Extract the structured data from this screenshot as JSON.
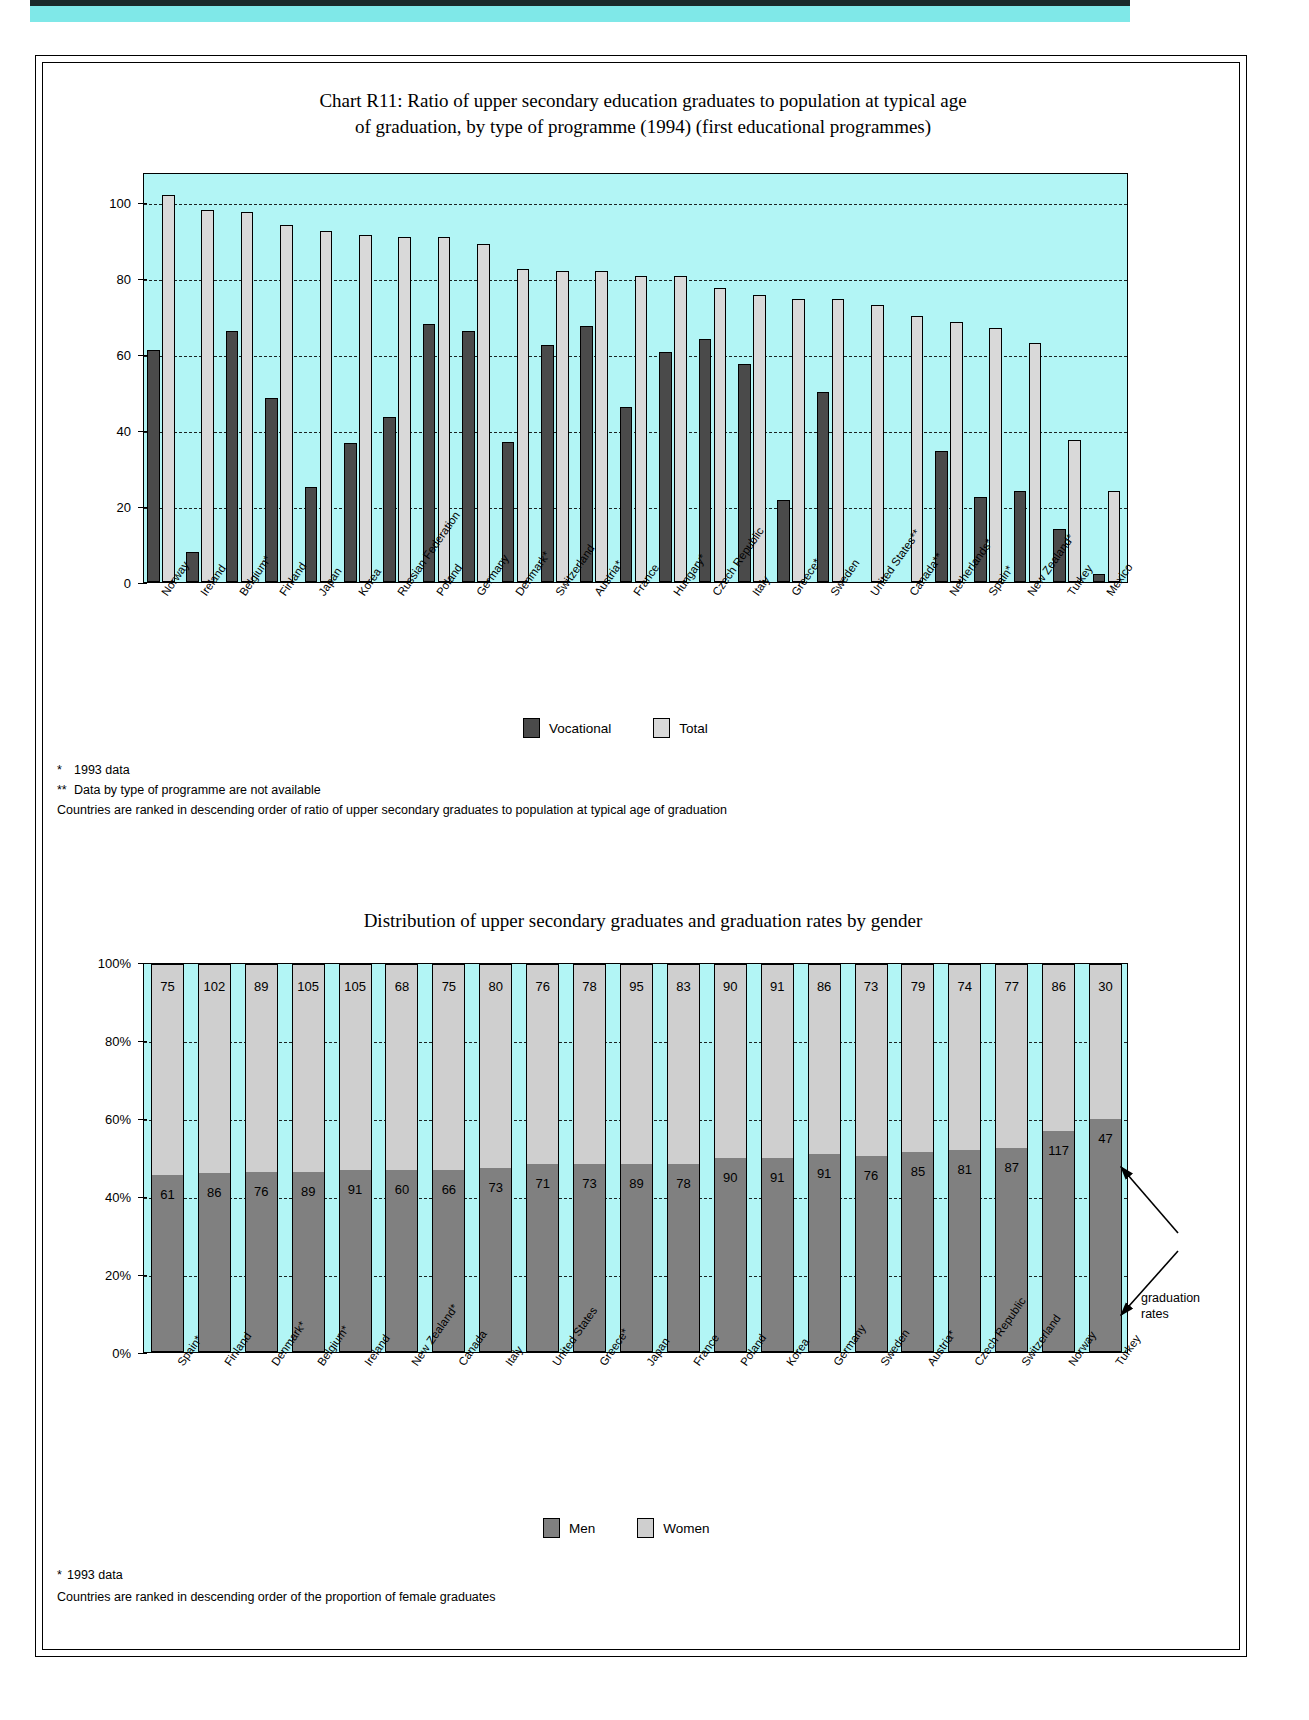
{
  "chart_data": [
    {
      "type": "bar",
      "id": "chart-r11",
      "title": "Chart R11: Ratio of upper secondary education graduates to population at typical age of graduation, by type of programme (1994) (first educational programmes)",
      "title_line1": "Chart R11: Ratio of upper secondary education graduates to population at typical age",
      "title_line2": "of graduation, by type of programme (1994) (first educational programmes)",
      "xlabel": "",
      "ylabel": "",
      "ylim": [
        0,
        108
      ],
      "yticks": [
        0,
        20,
        40,
        60,
        80,
        100
      ],
      "grid": true,
      "legend_position": "bottom",
      "categories": [
        "Norway",
        "Ireland",
        "Belgium*",
        "Finland",
        "Japan",
        "Korea",
        "Russian Federation",
        "Poland",
        "Germany",
        "Denmark*",
        "Switzerland",
        "Austria*",
        "France",
        "Hungary*",
        "Czech Republic",
        "Italy",
        "Greece*",
        "Sweden",
        "United States**",
        "Canada**",
        "Netherlands*",
        "Spain*",
        "New Zealand*",
        "Turkey",
        "Mexico"
      ],
      "series": [
        {
          "name": "Vocational",
          "color": "#4a4a4a",
          "values": [
            61,
            8,
            66,
            48.5,
            25,
            36.5,
            43.5,
            68,
            66,
            37,
            62.5,
            67.5,
            46,
            60.5,
            64,
            57.5,
            21.5,
            50,
            null,
            null,
            34.5,
            22.5,
            24,
            14,
            2
          ]
        },
        {
          "name": "Total",
          "color": "#d9d9d9",
          "values": [
            102,
            98,
            97.5,
            94,
            92.5,
            91.5,
            91,
            91,
            89,
            82.5,
            82,
            82,
            80.5,
            80.5,
            77.5,
            75.5,
            74.5,
            74.5,
            73,
            70,
            68.5,
            67,
            63,
            37.5,
            24
          ]
        }
      ],
      "notes": [
        {
          "marker": "*",
          "text": "1993 data"
        },
        {
          "marker": "**",
          "text": "Data by type of programme are not available"
        },
        {
          "marker": "",
          "text": "Countries are ranked in descending order of ratio of upper secondary graduates to population at typical age of graduation"
        }
      ]
    },
    {
      "type": "bar",
      "id": "chart-gender",
      "title": "Distribution of upper secondary graduates and graduation rates by gender",
      "stacked": true,
      "xlabel": "",
      "ylabel": "",
      "ylim": [
        0,
        100
      ],
      "yticks": [
        "0%",
        "20%",
        "40%",
        "60%",
        "80%",
        "100%"
      ],
      "grid": true,
      "legend_position": "bottom",
      "categories": [
        "Spain*",
        "Finland",
        "Denmark*",
        "Belgium*",
        "Ireland",
        "New Zealand*",
        "Canada",
        "Italy",
        "United States",
        "Greece*",
        "Japan",
        "France",
        "Poland",
        "Korea",
        "Germany",
        "Sweden",
        "Austria*",
        "Czech Republic",
        "Switzerland",
        "Norway",
        "Turkey"
      ],
      "series": [
        {
          "name": "Men",
          "color": "#808080",
          "share": [
            45.5,
            46,
            46.5,
            46.5,
            47,
            47,
            47,
            47.5,
            48.5,
            48.5,
            48.5,
            48.5,
            50,
            50,
            51,
            50.5,
            51.5,
            52,
            52.5,
            57,
            60
          ],
          "labels": [
            61,
            86,
            76,
            89,
            91,
            60,
            66,
            73,
            71,
            73,
            89,
            78,
            90,
            91,
            91,
            76,
            85,
            81,
            87,
            117,
            47
          ]
        },
        {
          "name": "Women",
          "color": "#cfcfcf",
          "share": [
            54.5,
            54,
            53.5,
            53.5,
            53,
            53,
            53,
            52.5,
            51.5,
            51.5,
            51.5,
            51.5,
            50,
            50,
            49,
            49.5,
            48.5,
            48,
            47.5,
            43,
            40
          ],
          "labels": [
            75,
            102,
            89,
            105,
            105,
            68,
            75,
            80,
            76,
            78,
            95,
            83,
            90,
            91,
            86,
            73,
            79,
            74,
            77,
            86,
            30
          ]
        }
      ],
      "annotation": {
        "text_line1": "graduation",
        "text_line2": "rates"
      },
      "notes": [
        {
          "marker": "*",
          "text": "1993 data"
        },
        {
          "marker": "",
          "text": "Countries are ranked in descending order of the proportion of female graduates"
        }
      ]
    }
  ],
  "chart1": {
    "legend": [
      {
        "label": "Vocational"
      },
      {
        "label": "Total"
      }
    ]
  },
  "chart2": {
    "legend": [
      {
        "label": "Men"
      },
      {
        "label": "Women"
      }
    ]
  }
}
